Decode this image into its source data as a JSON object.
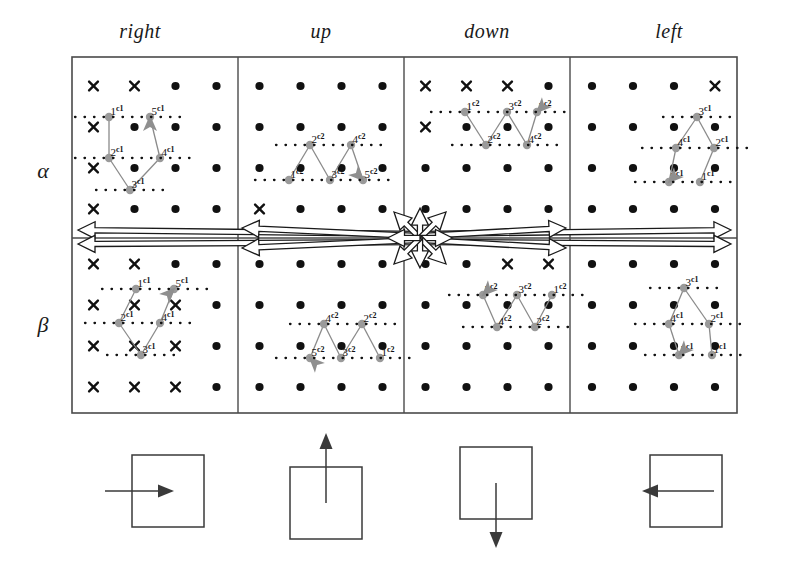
{
  "figure": {
    "title": "",
    "column_headers": [
      "right",
      "up",
      "down",
      "left"
    ],
    "row_headers": [
      "α",
      "β"
    ],
    "node_superscript_c1": "c1",
    "node_superscript_c2": "c2",
    "colors": {
      "lattice_dot": "#111111",
      "lattice_cross": "#111111",
      "panel_border": "#4a4a4a",
      "path_line": "#8a8a8a",
      "path_node": "#9a9a9a",
      "arrow_head": "#8f8f8f",
      "legend_stroke": "#3a3a3a",
      "hollow_arrow": "#1a1a1a",
      "background": "#ffffff"
    },
    "geometry": {
      "panel_left": 72,
      "panel_top": 57,
      "panel_right": 737,
      "panel_bottom": 413,
      "col_dividers": [
        238,
        404,
        570
      ],
      "row_divider": 238,
      "lattice_step_x": 41,
      "lattice_step_y": 41,
      "hub_x": 420,
      "hub_y": 238
    },
    "cells": [
      {
        "row": "α",
        "col": "right",
        "superscript": "c1",
        "nodes": [
          {
            "label": "1",
            "x": 109,
            "y": 117
          },
          {
            "label": "2",
            "x": 109,
            "y": 158
          },
          {
            "label": "3",
            "x": 130,
            "y": 190
          },
          {
            "label": "4",
            "x": 160,
            "y": 158
          },
          {
            "label": "5",
            "x": 150,
            "y": 117
          }
        ],
        "path": [
          "1",
          "2",
          "3",
          "4",
          "5"
        ],
        "arrow_at": "5",
        "arrow_dir": "up"
      },
      {
        "row": "α",
        "col": "up",
        "superscript": "c2",
        "nodes": [
          {
            "label": "1",
            "x": 289,
            "y": 180
          },
          {
            "label": "2",
            "x": 310,
            "y": 145
          },
          {
            "label": "3",
            "x": 330,
            "y": 180
          },
          {
            "label": "4",
            "x": 351,
            "y": 145
          },
          {
            "label": "5",
            "x": 363,
            "y": 180
          }
        ],
        "path": [
          "1",
          "2",
          "3",
          "4",
          "5"
        ],
        "arrow_at": "5",
        "arrow_dir": "down-right"
      },
      {
        "row": "α",
        "col": "down",
        "superscript": "c2",
        "nodes": [
          {
            "label": "1",
            "x": 465,
            "y": 112
          },
          {
            "label": "2",
            "x": 486,
            "y": 145
          },
          {
            "label": "3",
            "x": 507,
            "y": 112
          },
          {
            "label": "4",
            "x": 527,
            "y": 145
          },
          {
            "label": "5",
            "x": 537,
            "y": 112
          }
        ],
        "path": [
          "1",
          "2",
          "3",
          "4",
          "5"
        ],
        "arrow_at": "5",
        "arrow_dir": "down-left"
      },
      {
        "row": "α",
        "col": "left",
        "superscript": "c1",
        "nodes": [
          {
            "label": "3",
            "x": 697,
            "y": 117
          },
          {
            "label": "2",
            "x": 714,
            "y": 148
          },
          {
            "label": "4",
            "x": 676,
            "y": 148
          },
          {
            "label": "1",
            "x": 700,
            "y": 182
          },
          {
            "label": "5",
            "x": 669,
            "y": 182
          }
        ],
        "path": [
          "1",
          "2",
          "3",
          "4",
          "5"
        ],
        "arrow_at": "5",
        "arrow_dir": "down-left"
      },
      {
        "row": "β",
        "col": "right",
        "superscript": "c1",
        "nodes": [
          {
            "label": "1",
            "x": 136,
            "y": 289
          },
          {
            "label": "2",
            "x": 119,
            "y": 323
          },
          {
            "label": "3",
            "x": 141,
            "y": 355
          },
          {
            "label": "4",
            "x": 160,
            "y": 323
          },
          {
            "label": "5",
            "x": 174,
            "y": 289
          }
        ],
        "path": [
          "1",
          "2",
          "3",
          "4",
          "5"
        ],
        "arrow_at": "5",
        "arrow_dir": "up-right"
      },
      {
        "row": "β",
        "col": "up",
        "superscript": "c2",
        "nodes": [
          {
            "label": "1",
            "x": 380,
            "y": 358
          },
          {
            "label": "2",
            "x": 362,
            "y": 324
          },
          {
            "label": "3",
            "x": 341,
            "y": 358
          },
          {
            "label": "4",
            "x": 324,
            "y": 324
          },
          {
            "label": "5",
            "x": 310,
            "y": 358
          }
        ],
        "path": [
          "1",
          "2",
          "3",
          "4",
          "5"
        ],
        "arrow_at": "5",
        "arrow_dir": "up-left"
      },
      {
        "row": "β",
        "col": "down",
        "superscript": "c2",
        "nodes": [
          {
            "label": "1",
            "x": 552,
            "y": 295
          },
          {
            "label": "2",
            "x": 535,
            "y": 327
          },
          {
            "label": "3",
            "x": 517,
            "y": 295
          },
          {
            "label": "4",
            "x": 497,
            "y": 327
          },
          {
            "label": "5",
            "x": 483,
            "y": 295
          }
        ],
        "path": [
          "1",
          "2",
          "3",
          "4",
          "5"
        ],
        "arrow_at": "5",
        "arrow_dir": "down-left"
      },
      {
        "row": "β",
        "col": "left",
        "superscript": "c1",
        "nodes": [
          {
            "label": "3",
            "x": 684,
            "y": 288
          },
          {
            "label": "2",
            "x": 709,
            "y": 324
          },
          {
            "label": "4",
            "x": 669,
            "y": 324
          },
          {
            "label": "1",
            "x": 712,
            "y": 355
          },
          {
            "label": "5",
            "x": 679,
            "y": 355
          }
        ],
        "path": [
          "1",
          "2",
          "3",
          "4",
          "5"
        ],
        "arrow_at": "5",
        "arrow_dir": "down-left"
      }
    ],
    "legend": [
      {
        "direction": "right",
        "box_x": 132,
        "box_y": 455,
        "box_w": 72,
        "box_h": 72,
        "arrow": {
          "x1": 105,
          "y1": 491,
          "x2": 174,
          "y2": 491
        }
      },
      {
        "direction": "up",
        "box_x": 290,
        "box_y": 467,
        "box_w": 72,
        "box_h": 72,
        "arrow": {
          "x1": 326,
          "y1": 503,
          "x2": 326,
          "y2": 433
        }
      },
      {
        "direction": "down",
        "box_x": 460,
        "box_y": 447,
        "box_w": 72,
        "box_h": 72,
        "arrow": {
          "x1": 496,
          "y1": 483,
          "x2": 496,
          "y2": 548
        }
      },
      {
        "direction": "left",
        "box_x": 650,
        "box_y": 455,
        "box_w": 72,
        "box_h": 72,
        "arrow": {
          "x1": 714,
          "y1": 491,
          "x2": 642,
          "y2": 491
        }
      }
    ]
  }
}
